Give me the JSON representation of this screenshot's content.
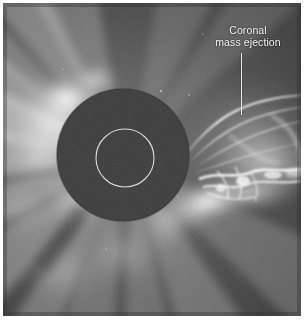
{
  "figure": {
    "kind": "coronagraph-photograph",
    "background_color": "#ffffff"
  },
  "annotation": {
    "line1": "Coronal",
    "line2": "mass ejection",
    "text_color": "#f2f2f2",
    "leader_line_color": "#e8e8e8"
  },
  "image": {
    "occulting_disk": {
      "center_x": 123,
      "center_y": 155,
      "radius": 66,
      "color": "#3a3a3a"
    },
    "sun_circle": {
      "center_x": 125,
      "center_y": 158,
      "radius": 29,
      "stroke_color": "#dedede"
    },
    "sky_color": "#434343",
    "corona_color": "#f5f5f5"
  }
}
